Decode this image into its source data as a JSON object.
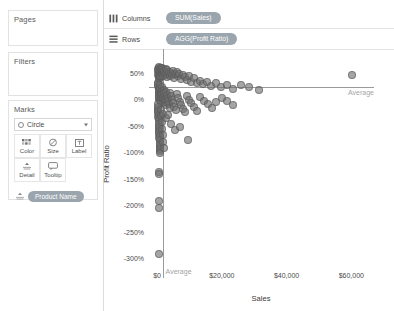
{
  "sidebar": {
    "pages": {
      "title": "Pages"
    },
    "filters": {
      "title": "Filters"
    },
    "marks": {
      "title": "Marks",
      "mark_type": "Circle",
      "buttons": [
        {
          "label": "Color",
          "icon": "color-palette-icon"
        },
        {
          "label": "Size",
          "icon": "size-icon"
        },
        {
          "label": "Label",
          "icon": "label-icon"
        },
        {
          "label": "Detail",
          "icon": "detail-icon"
        },
        {
          "label": "Tooltip",
          "icon": "tooltip-icon"
        }
      ],
      "detail_pill": "Product Name"
    }
  },
  "shelves": {
    "columns": {
      "label": "Columns",
      "pill": "SUM(Sales)",
      "icon": "columns-icon"
    },
    "rows": {
      "label": "Rows",
      "pill": "AGG(Profit Ratio)",
      "icon": "rows-icon"
    }
  },
  "colors": {
    "pill": "#9aa5ae",
    "mark": "rgba(110,110,110,0.62)",
    "refline": "#9b9b9b",
    "reflabel": "#a5a5a5"
  },
  "chart_data": {
    "type": "scatter",
    "title": "",
    "xlabel": "Sales",
    "ylabel": "Profit Ratio",
    "xlim": [
      -2500,
      67000
    ],
    "ylim": [
      -3.15,
      0.72
    ],
    "grid": false,
    "legend": false,
    "xticks": [
      {
        "value": 0,
        "label": "$0"
      },
      {
        "value": 20000,
        "label": "$20,000"
      },
      {
        "value": 40000,
        "label": "$40,000"
      },
      {
        "value": 60000,
        "label": "$60,000"
      }
    ],
    "yticks": [
      {
        "value": 0.5,
        "label": "50%"
      },
      {
        "value": 0.0,
        "label": "0%"
      },
      {
        "value": -0.5,
        "label": "-50%"
      },
      {
        "value": -1.0,
        "label": "-100%"
      },
      {
        "value": -1.5,
        "label": "-150%"
      },
      {
        "value": -2.0,
        "label": "-200%"
      },
      {
        "value": -2.5,
        "label": "-250%"
      },
      {
        "value": -3.0,
        "label": "-300%"
      }
    ],
    "reference_lines": [
      {
        "orientation": "horizontal",
        "value": 0.22,
        "label": "Average",
        "label_position": "right"
      },
      {
        "orientation": "vertical",
        "value": 1700,
        "label": "Average",
        "label_position": "bottom"
      }
    ],
    "series": [
      {
        "name": "Product Name",
        "marker": "circle",
        "points": [
          [
            300,
            0.56
          ],
          [
            420,
            0.54
          ],
          [
            520,
            0.58
          ],
          [
            610,
            0.5
          ],
          [
            700,
            0.6
          ],
          [
            350,
            0.46
          ],
          [
            480,
            0.42
          ],
          [
            560,
            0.38
          ],
          [
            640,
            0.44
          ],
          [
            760,
            0.52
          ],
          [
            840,
            0.56
          ],
          [
            900,
            0.48
          ],
          [
            980,
            0.4
          ],
          [
            1050,
            0.55
          ],
          [
            1150,
            0.58
          ],
          [
            1250,
            0.5
          ],
          [
            1350,
            0.44
          ],
          [
            1450,
            0.54
          ],
          [
            1550,
            0.47
          ],
          [
            1650,
            0.59
          ],
          [
            1750,
            0.51
          ],
          [
            1850,
            0.43
          ],
          [
            1950,
            0.56
          ],
          [
            2100,
            0.49
          ],
          [
            2250,
            0.53
          ],
          [
            2400,
            0.45
          ],
          [
            2600,
            0.57
          ],
          [
            2800,
            0.5
          ],
          [
            3000,
            0.42
          ],
          [
            3200,
            0.55
          ],
          [
            3400,
            0.48
          ],
          [
            3600,
            0.52
          ],
          [
            3900,
            0.44
          ],
          [
            4200,
            0.5
          ],
          [
            4500,
            0.46
          ],
          [
            4800,
            0.54
          ],
          [
            5200,
            0.4
          ],
          [
            5600,
            0.47
          ],
          [
            6000,
            0.51
          ],
          [
            6400,
            0.43
          ],
          [
            6900,
            0.48
          ],
          [
            7400,
            0.38
          ],
          [
            7900,
            0.45
          ],
          [
            8500,
            0.41
          ],
          [
            9100,
            0.36
          ],
          [
            9800,
            0.44
          ],
          [
            10500,
            0.33
          ],
          [
            11300,
            0.39
          ],
          [
            12200,
            0.3
          ],
          [
            13200,
            0.35
          ],
          [
            14300,
            0.28
          ],
          [
            15500,
            0.32
          ],
          [
            16800,
            0.25
          ],
          [
            18200,
            0.3
          ],
          [
            19800,
            0.22
          ],
          [
            21500,
            0.27
          ],
          [
            23500,
            0.2
          ],
          [
            25800,
            0.26
          ],
          [
            28500,
            0.23
          ],
          [
            31500,
            0.18
          ],
          [
            60200,
            0.45
          ],
          [
            300,
            0.3
          ],
          [
            380,
            0.24
          ],
          [
            460,
            0.18
          ],
          [
            540,
            0.12
          ],
          [
            620,
            0.06
          ],
          [
            700,
            0.01
          ],
          [
            420,
            0.28
          ],
          [
            500,
            0.21
          ],
          [
            580,
            0.15
          ],
          [
            660,
            0.08
          ],
          [
            740,
            0.03
          ],
          [
            820,
            -0.02
          ],
          [
            900,
            0.26
          ],
          [
            980,
            0.19
          ],
          [
            1060,
            0.13
          ],
          [
            1140,
            0.07
          ],
          [
            1220,
            0.0
          ],
          [
            1300,
            -0.05
          ],
          [
            1400,
            0.22
          ],
          [
            1500,
            0.16
          ],
          [
            1600,
            0.1
          ],
          [
            1700,
            0.04
          ],
          [
            1800,
            -0.01
          ],
          [
            1900,
            -0.07
          ],
          [
            2000,
            0.18
          ],
          [
            2150,
            0.11
          ],
          [
            2300,
            0.05
          ],
          [
            2450,
            -0.01
          ],
          [
            2600,
            -0.06
          ],
          [
            2750,
            -0.12
          ],
          [
            2900,
            0.14
          ],
          [
            3100,
            0.08
          ],
          [
            3300,
            0.02
          ],
          [
            3500,
            -0.04
          ],
          [
            3700,
            -0.1
          ],
          [
            3900,
            -0.16
          ],
          [
            4100,
            0.12
          ],
          [
            4400,
            0.05
          ],
          [
            4700,
            -0.02
          ],
          [
            5000,
            -0.08
          ],
          [
            5300,
            -0.14
          ],
          [
            5700,
            -0.2
          ],
          [
            6100,
            0.09
          ],
          [
            6500,
            0.02
          ],
          [
            7000,
            -0.05
          ],
          [
            7500,
            -0.12
          ],
          [
            8000,
            -0.18
          ],
          [
            8600,
            -0.24
          ],
          [
            9200,
            0.06
          ],
          [
            9900,
            -0.01
          ],
          [
            10600,
            -0.08
          ],
          [
            11400,
            -0.15
          ],
          [
            12300,
            -0.22
          ],
          [
            13300,
            0.04
          ],
          [
            14400,
            -0.03
          ],
          [
            15600,
            -0.1
          ],
          [
            16900,
            -0.17
          ],
          [
            18300,
            -0.06
          ],
          [
            19900,
            0.02
          ],
          [
            21600,
            -0.04
          ],
          [
            23600,
            -0.12
          ],
          [
            250,
            -0.1
          ],
          [
            300,
            -0.18
          ],
          [
            360,
            -0.26
          ],
          [
            420,
            -0.34
          ],
          [
            480,
            -0.42
          ],
          [
            540,
            -0.5
          ],
          [
            600,
            -0.58
          ],
          [
            660,
            -0.66
          ],
          [
            720,
            -0.74
          ],
          [
            780,
            -0.82
          ],
          [
            840,
            -0.9
          ],
          [
            900,
            -0.98
          ],
          [
            330,
            -0.14
          ],
          [
            390,
            -0.22
          ],
          [
            450,
            -0.3
          ],
          [
            510,
            -0.38
          ],
          [
            570,
            -0.46
          ],
          [
            630,
            -0.54
          ],
          [
            690,
            -0.62
          ],
          [
            750,
            -0.7
          ],
          [
            810,
            -0.78
          ],
          [
            870,
            -0.86
          ],
          [
            930,
            -0.94
          ],
          [
            990,
            -1.02
          ],
          [
            1100,
            -0.2
          ],
          [
            1250,
            -0.32
          ],
          [
            1400,
            -0.44
          ],
          [
            1550,
            -0.56
          ],
          [
            1700,
            -0.68
          ],
          [
            1850,
            -0.8
          ],
          [
            2000,
            -0.92
          ],
          [
            1900,
            -0.28
          ],
          [
            2600,
            -0.36
          ],
          [
            3400,
            -0.3
          ],
          [
            4300,
            -0.46
          ],
          [
            5400,
            -0.58
          ],
          [
            7200,
            -0.52
          ],
          [
            9600,
            -0.78
          ],
          [
            650,
            -1.38
          ],
          [
            700,
            -1.42
          ],
          [
            620,
            -1.92
          ],
          [
            660,
            -2.06
          ],
          [
            640,
            -2.92
          ]
        ]
      }
    ]
  }
}
